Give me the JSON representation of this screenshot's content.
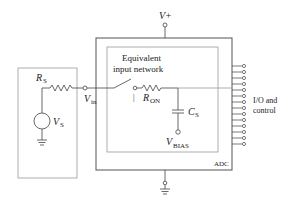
{
  "diagram": {
    "type": "circuit-schematic",
    "source": {
      "resistor_label": "R",
      "resistor_sub": "S",
      "voltage_label": "V",
      "voltage_sub": "S"
    },
    "input_node": {
      "label": "V",
      "sub": "in"
    },
    "supply": {
      "label": "V+"
    },
    "inner_box": {
      "title_line1": "Equivalent",
      "title_line2": "input network",
      "switch_mark": "|",
      "ron_label": "R",
      "ron_sub": "ON",
      "cap_label": "C",
      "cap_sub": "S",
      "bias_label": "V",
      "bias_sub": "BIAS"
    },
    "adc_box": {
      "label": "ADC"
    },
    "io": {
      "line1": "I/O and",
      "line2": "control",
      "pin_count": 14
    },
    "colors": {
      "line": "#4a4a4a",
      "box": "#888888",
      "text": "#222222"
    }
  }
}
